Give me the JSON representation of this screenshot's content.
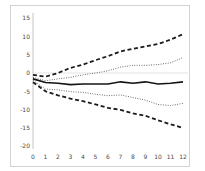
{
  "chart_data": {
    "type": "line",
    "title": "",
    "xlabel": "",
    "ylabel": "",
    "x": [
      0,
      1,
      2,
      3,
      4,
      5,
      6,
      7,
      8,
      9,
      10,
      11,
      12
    ],
    "x_tick_labels": [
      "0",
      "1",
      "2",
      "3",
      "4",
      "5",
      "6",
      "7",
      "8",
      "9",
      "10",
      "11",
      "12"
    ],
    "y_tick_labels": [
      "15",
      "10",
      "5",
      "0",
      "-5",
      "-10",
      "-15",
      "-20"
    ],
    "y_tick_values": [
      15,
      10,
      5,
      0,
      -5,
      -10,
      -15,
      -20
    ],
    "ylim": [
      -20,
      15
    ],
    "xlim": [
      0,
      12
    ],
    "grid": "horizontal-zero-line-only",
    "legend": "none",
    "series": [
      {
        "name": "upper-outer-band",
        "style": "bold-dashed",
        "color": "#1b1b1b",
        "values": [
          -0.5,
          -1.0,
          0.0,
          1.4,
          2.3,
          3.5,
          4.6,
          5.9,
          6.6,
          7.3,
          7.9,
          9.1,
          10.6
        ]
      },
      {
        "name": "upper-inner-band",
        "style": "dotted",
        "color": "#4d4d4d",
        "values": [
          -1.2,
          -2.1,
          -1.6,
          -1.2,
          -0.5,
          0.0,
          0.6,
          1.6,
          2.1,
          2.1,
          2.3,
          2.8,
          4.2
        ]
      },
      {
        "name": "center-estimate",
        "style": "solid-bold",
        "color": "#141414",
        "values": [
          -1.6,
          -2.6,
          -2.8,
          -3.2,
          -3.0,
          -3.0,
          -3.0,
          -2.4,
          -2.8,
          -2.4,
          -3.0,
          -2.8,
          -2.4
        ]
      },
      {
        "name": "lower-inner-band",
        "style": "dotted",
        "color": "#4d4d4d",
        "values": [
          -2.0,
          -4.4,
          -4.6,
          -5.1,
          -5.3,
          -5.8,
          -6.2,
          -6.0,
          -6.7,
          -7.4,
          -8.6,
          -8.9,
          -8.3
        ]
      },
      {
        "name": "lower-outer-band",
        "style": "bold-dashed",
        "color": "#1b1b1b",
        "values": [
          -2.5,
          -5.0,
          -6.1,
          -7.0,
          -7.7,
          -8.6,
          -9.5,
          -10.1,
          -11.0,
          -11.7,
          -12.9,
          -14.0,
          -15.0
        ]
      }
    ]
  },
  "frame": {
    "border_color": "#c9c9c9",
    "axis_color": "#b5b5b5",
    "zero_line_color": "#dcdcdc",
    "background": "#ffffff"
  }
}
